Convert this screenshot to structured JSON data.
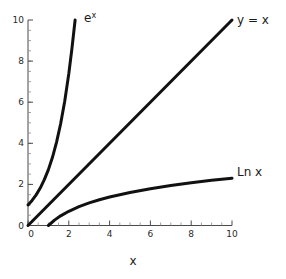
{
  "chart_data": {
    "type": "line",
    "title": "",
    "xlabel": "x",
    "ylabel": "",
    "xlim": [
      0,
      10
    ],
    "ylim": [
      0,
      10
    ],
    "grid": false,
    "legend_position": "inline-curve-labels",
    "x_ticks": [
      0,
      2,
      4,
      6,
      8,
      10
    ],
    "x_tick_labels": [
      "0",
      "2",
      "4",
      "6",
      "8",
      "10"
    ],
    "y_ticks": [
      0,
      2,
      4,
      6,
      8,
      10
    ],
    "y_tick_labels": [
      "0",
      "2",
      "4",
      "6",
      "8",
      "10"
    ],
    "x_minor_tick_step": 0.5,
    "y_minor_tick_step": 0.5,
    "line_color": "#111111",
    "axis_color": "#4a4a4a",
    "background_color": "#ffffff",
    "series": [
      {
        "name": "e^x",
        "label_text": "e",
        "label_superscript": "x",
        "label_x": 2.4,
        "label_y": 10.1,
        "domain": [
          0,
          2.31
        ],
        "points": [
          {
            "x": 0.0,
            "y": 1.0
          },
          {
            "x": 0.2,
            "y": 1.22
          },
          {
            "x": 0.4,
            "y": 1.49
          },
          {
            "x": 0.6,
            "y": 1.82
          },
          {
            "x": 0.8,
            "y": 2.23
          },
          {
            "x": 1.0,
            "y": 2.72
          },
          {
            "x": 1.2,
            "y": 3.32
          },
          {
            "x": 1.4,
            "y": 4.06
          },
          {
            "x": 1.6,
            "y": 4.95
          },
          {
            "x": 1.8,
            "y": 6.05
          },
          {
            "x": 2.0,
            "y": 7.39
          },
          {
            "x": 2.15,
            "y": 8.58
          },
          {
            "x": 2.31,
            "y": 10.0
          }
        ]
      },
      {
        "name": "y = x",
        "label_text": "y = x",
        "label_superscript": "",
        "label_x": 10.4,
        "label_y": 10.1,
        "domain": [
          0,
          10
        ],
        "points": [
          {
            "x": 0.0,
            "y": 0.0
          },
          {
            "x": 10.0,
            "y": 10.0
          }
        ]
      },
      {
        "name": "Ln x",
        "label_text": "Ln x",
        "label_superscript": "",
        "label_x": 10.4,
        "label_y": 2.55,
        "domain": [
          1,
          10
        ],
        "points": [
          {
            "x": 1.0,
            "y": 0.0
          },
          {
            "x": 1.3,
            "y": 0.262
          },
          {
            "x": 1.6,
            "y": 0.47
          },
          {
            "x": 2.0,
            "y": 0.693
          },
          {
            "x": 2.5,
            "y": 0.916
          },
          {
            "x": 3.0,
            "y": 1.099
          },
          {
            "x": 3.5,
            "y": 1.253
          },
          {
            "x": 4.0,
            "y": 1.386
          },
          {
            "x": 5.0,
            "y": 1.609
          },
          {
            "x": 6.0,
            "y": 1.792
          },
          {
            "x": 7.0,
            "y": 1.946
          },
          {
            "x": 8.0,
            "y": 2.079
          },
          {
            "x": 9.0,
            "y": 2.197
          },
          {
            "x": 10.0,
            "y": 2.303
          }
        ]
      }
    ]
  },
  "axis_titles": {
    "x": "x"
  },
  "tick_labels": {
    "y_10": "10",
    "y_8": "8",
    "y_6": "6",
    "y_4": "4",
    "y_2": "2",
    "y_0": "0",
    "x_0": "0",
    "x_2": "2",
    "x_4": "4",
    "x_6": "6",
    "x_8": "8",
    "x_10": "10"
  },
  "curve_labels": {
    "exp_base": "e",
    "exp_exponent": "x",
    "identity": "y = x",
    "log": "Ln x"
  }
}
